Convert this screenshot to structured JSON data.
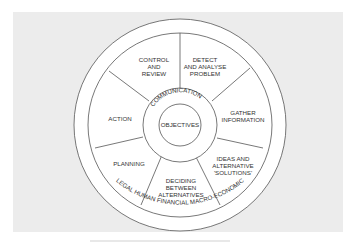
{
  "diagram": {
    "type": "concentric-wheel",
    "outer_ring": {
      "top_label": "CONSTRAINTS",
      "bottom_label": "LEGAL HUMAN FINANCIAL MACRO-ECONOMIC"
    },
    "segments": [
      {
        "id": "control-and-review",
        "lines": [
          "CONTROL",
          "AND",
          "REVIEW"
        ]
      },
      {
        "id": "detect-and-analyse-problem",
        "lines": [
          "DETECT",
          "AND ANALYSE",
          "PROBLEM"
        ]
      },
      {
        "id": "gather-information",
        "lines": [
          "GATHER",
          "INFORMATION"
        ]
      },
      {
        "id": "ideas-and-alternative-solutions",
        "lines": [
          "IDEAS AND",
          "ALTERNATIVE",
          "'SOLUTIONS'"
        ]
      },
      {
        "id": "deciding-between-alternatives",
        "lines": [
          "DECIDING",
          "BETWEEN",
          "ALTERNATIVES"
        ]
      },
      {
        "id": "planning",
        "lines": [
          "PLANNING"
        ]
      },
      {
        "id": "action",
        "lines": [
          "ACTION"
        ]
      }
    ],
    "inner_ring_label": "COMMUNICATION",
    "center_label": "OBJECTIVES"
  },
  "colors": {
    "background": "#ececec",
    "circle_fill": "#ffffff",
    "stroke": "#555555",
    "text": "#333333"
  }
}
